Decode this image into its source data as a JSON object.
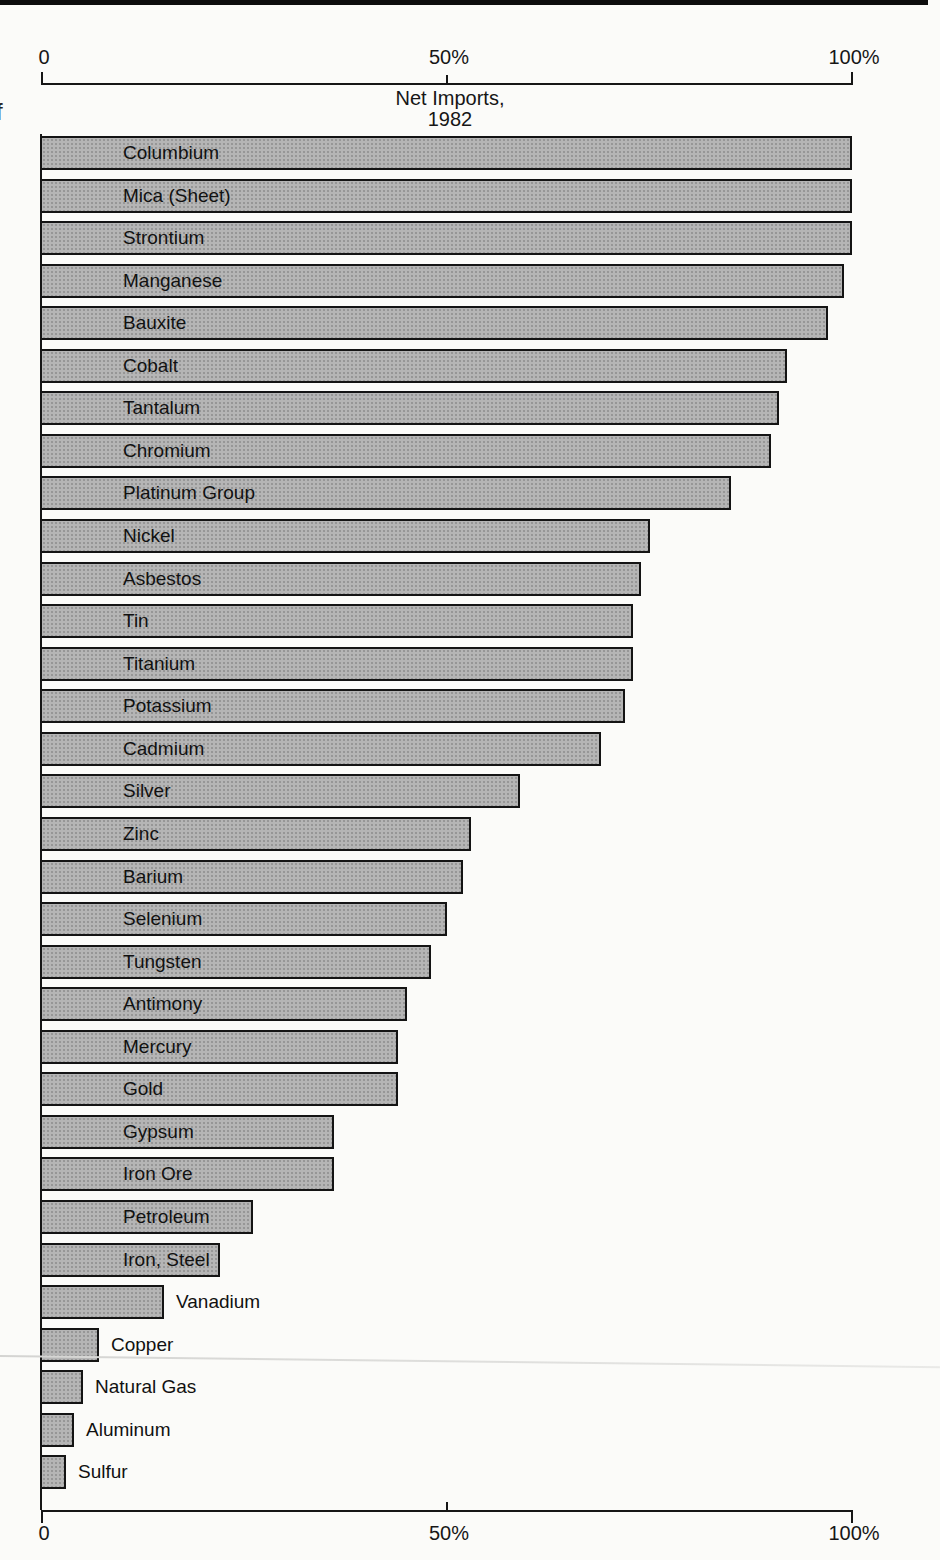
{
  "page": {
    "margin_fragment": "f"
  },
  "chart_data": {
    "type": "bar",
    "orientation": "horizontal",
    "title_lines": [
      "Net Imports,",
      "1982"
    ],
    "xlabel": "",
    "ylabel": "",
    "xlim": [
      0,
      100
    ],
    "x_axis": {
      "ticks": [
        {
          "label": "0",
          "value": 0
        },
        {
          "label": "50%",
          "value": 50
        },
        {
          "label": "100%",
          "value": 100
        }
      ],
      "shown_top_and_bottom": true
    },
    "bar_color": "#b5b5b5",
    "bar_border_color": "#141414",
    "items": [
      {
        "label": "Columbium",
        "value": 100,
        "label_inside": true
      },
      {
        "label": "Mica (Sheet)",
        "value": 100,
        "label_inside": true
      },
      {
        "label": "Strontium",
        "value": 100,
        "label_inside": true
      },
      {
        "label": "Manganese",
        "value": 99,
        "label_inside": true
      },
      {
        "label": "Bauxite",
        "value": 97,
        "label_inside": true
      },
      {
        "label": "Cobalt",
        "value": 92,
        "label_inside": true
      },
      {
        "label": "Tantalum",
        "value": 91,
        "label_inside": true
      },
      {
        "label": "Chromium",
        "value": 90,
        "label_inside": true
      },
      {
        "label": "Platinum Group",
        "value": 85,
        "label_inside": true
      },
      {
        "label": "Nickel",
        "value": 75,
        "label_inside": true
      },
      {
        "label": "Asbestos",
        "value": 74,
        "label_inside": true
      },
      {
        "label": "Tin",
        "value": 73,
        "label_inside": true
      },
      {
        "label": "Titanium",
        "value": 73,
        "label_inside": true
      },
      {
        "label": "Potassium",
        "value": 72,
        "label_inside": true
      },
      {
        "label": "Cadmium",
        "value": 69,
        "label_inside": true
      },
      {
        "label": "Silver",
        "value": 59,
        "label_inside": true
      },
      {
        "label": "Zinc",
        "value": 53,
        "label_inside": true
      },
      {
        "label": "Barium",
        "value": 52,
        "label_inside": true
      },
      {
        "label": "Selenium",
        "value": 50,
        "label_inside": true
      },
      {
        "label": "Tungsten",
        "value": 48,
        "label_inside": true
      },
      {
        "label": "Antimony",
        "value": 45,
        "label_inside": true
      },
      {
        "label": "Mercury",
        "value": 44,
        "label_inside": true
      },
      {
        "label": "Gold",
        "value": 44,
        "label_inside": true
      },
      {
        "label": "Gypsum",
        "value": 36,
        "label_inside": true
      },
      {
        "label": "Iron Ore",
        "value": 36,
        "label_inside": true
      },
      {
        "label": "Petroleum",
        "value": 26,
        "label_inside": true
      },
      {
        "label": "Iron, Steel",
        "value": 22,
        "label_inside": true
      },
      {
        "label": "Vanadium",
        "value": 15,
        "label_inside": false
      },
      {
        "label": "Copper",
        "value": 7,
        "label_inside": false
      },
      {
        "label": "Natural Gas",
        "value": 5,
        "label_inside": false
      },
      {
        "label": "Aluminum",
        "value": 4,
        "label_inside": false
      },
      {
        "label": "Sulfur",
        "value": 3,
        "label_inside": false
      }
    ]
  }
}
